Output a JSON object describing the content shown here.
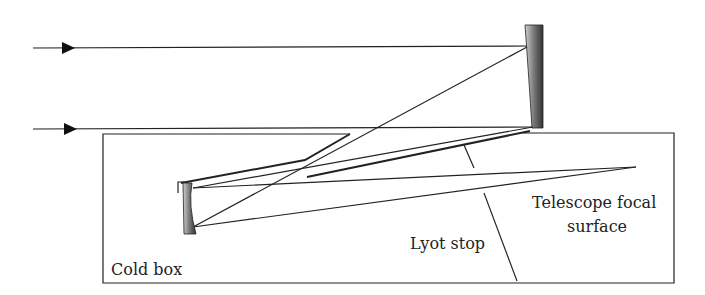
{
  "diagram": {
    "type": "optical-layout",
    "labels": {
      "cold_box": "Cold box",
      "lyot_stop": "Lyot stop",
      "focal_line1": "Telescope focal",
      "focal_line2": "surface"
    },
    "components": [
      "incoming-beam-top",
      "incoming-beam-bottom",
      "primary-mirror",
      "secondary-mirror",
      "cold-box",
      "lyot-stop",
      "focal-surface"
    ],
    "colors": {
      "line": "#222222",
      "mirror_dark": "#333333",
      "mirror_light": "#bbbbbb",
      "background": "#ffffff"
    }
  }
}
